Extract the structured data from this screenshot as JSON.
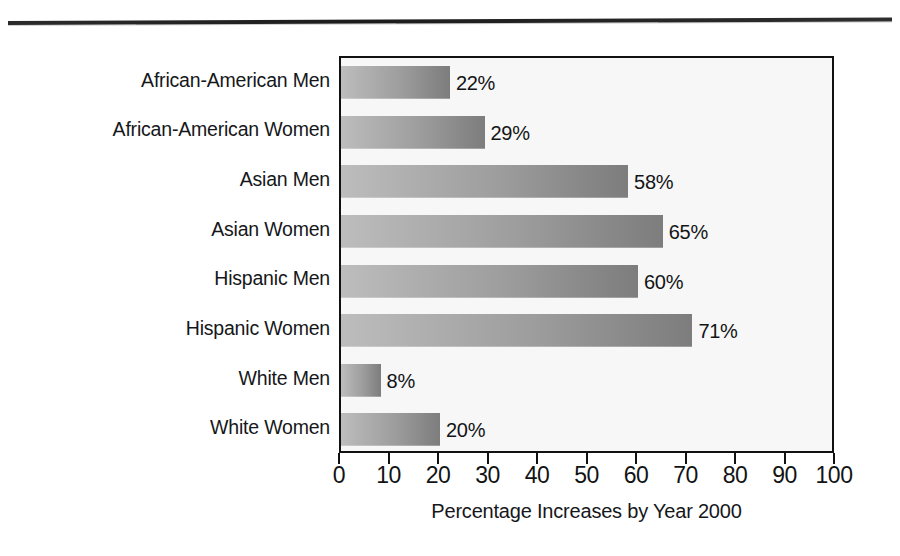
{
  "figure": {
    "top_rule": "horizontal-rule",
    "background_color": "#f7f7f7",
    "border_color": "#111111",
    "bar_gradient_start": "#bdbdbd",
    "bar_gradient_end": "#7d7d7d"
  },
  "chart_data": {
    "type": "bar",
    "orientation": "horizontal",
    "title": "",
    "xlabel": "Percentage Increases by Year 2000",
    "ylabel": "",
    "xlim": [
      0,
      100
    ],
    "xticks": [
      "0",
      "10",
      "20",
      "30",
      "40",
      "50",
      "60",
      "70",
      "80",
      "90",
      "100"
    ],
    "xtick_values": [
      0,
      10,
      20,
      30,
      40,
      50,
      60,
      70,
      80,
      90,
      100
    ],
    "grid": false,
    "legend": false,
    "categories": [
      "African-American Men",
      "African-American Women",
      "Asian Men",
      "Asian Women",
      "Hispanic Men",
      "Hispanic Women",
      "White Men",
      "White Women"
    ],
    "values": [
      22,
      29,
      58,
      65,
      60,
      71,
      8,
      20
    ],
    "value_labels": [
      "22%",
      "29%",
      "58%",
      "65%",
      "60%",
      "71%",
      "8%",
      "20%"
    ]
  }
}
